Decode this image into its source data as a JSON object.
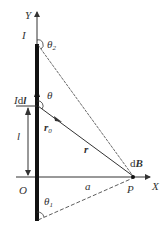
{
  "labels": {
    "y_axis": "Y",
    "x_axis": "X",
    "current": "I",
    "theta2": "θ",
    "theta2_sub": "2",
    "idl_prefix": "I",
    "idl_d": "d",
    "idl_l": "l",
    "theta": "θ",
    "length_l": "l",
    "r0": "r",
    "r0_sub": "0",
    "r": "r",
    "dB": "d",
    "dB_B": "B",
    "origin": "O",
    "a": "a",
    "P": "P",
    "theta1": "θ",
    "theta1_sub": "1"
  },
  "colors": {
    "line": "#333333",
    "wire": "#111111"
  }
}
